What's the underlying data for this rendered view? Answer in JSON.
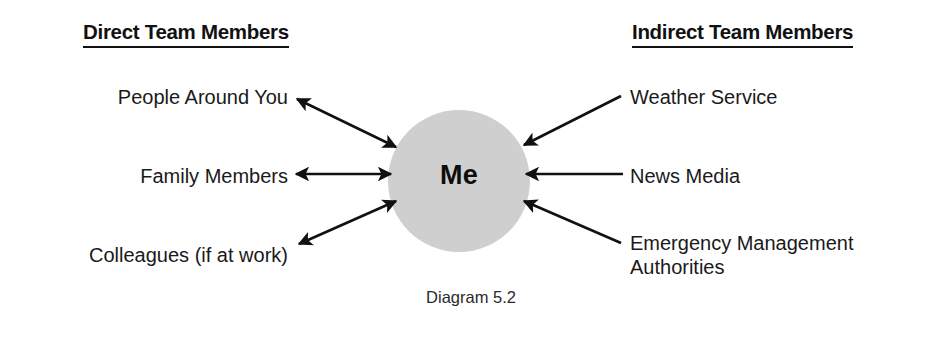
{
  "figure": {
    "caption": "Diagram 5.2",
    "center_node": {
      "label": "Me",
      "fill_color": "#cfcfcf"
    },
    "columns": {
      "left": {
        "header": "Direct Team Members",
        "items": [
          {
            "label": "People Around You",
            "arrow": "bidirectional"
          },
          {
            "label": "Family Members",
            "arrow": "bidirectional"
          },
          {
            "label": "Colleagues (if at work)",
            "arrow": "bidirectional"
          }
        ]
      },
      "right": {
        "header": "Indirect Team Members",
        "items": [
          {
            "label": "Weather Service",
            "arrow": "toward-center"
          },
          {
            "label": "News Media",
            "arrow": "toward-center"
          },
          {
            "label": "Emergency Management Authorities",
            "arrow": "toward-center"
          }
        ]
      }
    },
    "colors": {
      "ink": "#111111",
      "node_fill": "#cfcfcf",
      "background": "#ffffff"
    }
  }
}
